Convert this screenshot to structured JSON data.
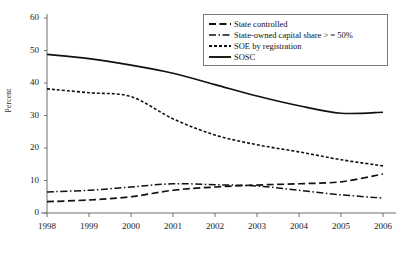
{
  "chart_data": {
    "type": "line",
    "title": "",
    "xlabel": "",
    "ylabel": "Percent",
    "x": [
      1998,
      1999,
      2000,
      2001,
      2002,
      2003,
      2004,
      2005,
      2006
    ],
    "xtick_labels": [
      "1998",
      "1999",
      "2000",
      "2001",
      "2002",
      "2003",
      "2004",
      "2005",
      "2006"
    ],
    "ytick_labels": [
      "0",
      "10",
      "20",
      "30",
      "40",
      "50",
      "60"
    ],
    "ytick_values": [
      0,
      10,
      20,
      30,
      40,
      50,
      60
    ],
    "ylim": [
      0,
      60
    ],
    "xlim": [
      1998,
      2006
    ],
    "grid": false,
    "legend_position": "top-right",
    "series": [
      {
        "name": "State controlled",
        "legend_label": "State controlled",
        "style": "long-dash",
        "values": [
          3.5,
          4.0,
          5.0,
          7.0,
          8.0,
          8.6,
          9.0,
          9.6,
          12.0
        ]
      },
      {
        "name": "State-owned capital share > = 50%",
        "legend_label": "State-owned capital share > = 50%",
        "style": "dash-dot",
        "values": [
          6.5,
          7.0,
          8.0,
          9.0,
          8.7,
          8.3,
          7.0,
          5.6,
          4.6
        ]
      },
      {
        "name": "SOE by registration",
        "legend_label": "SOE by registration",
        "style": "short-dash",
        "values": [
          38.2,
          37.0,
          35.8,
          29.0,
          24.0,
          21.0,
          18.8,
          16.4,
          14.5
        ]
      },
      {
        "name": "SOSC",
        "legend_label": "SOSC",
        "style": "solid",
        "values": [
          48.8,
          47.5,
          45.5,
          43.0,
          39.5,
          36.0,
          33.0,
          30.7,
          31.0
        ]
      }
    ]
  },
  "axis": {
    "y_title": "Percent"
  },
  "legend": {
    "entries": [
      {
        "label": "State controlled",
        "style": "long-dash"
      },
      {
        "label": "State-owned capital share > = 50%",
        "style": "dash-dot"
      },
      {
        "label": "SOE by registration",
        "style": "short-dash"
      },
      {
        "label": "SOSC",
        "style": "solid"
      }
    ]
  }
}
